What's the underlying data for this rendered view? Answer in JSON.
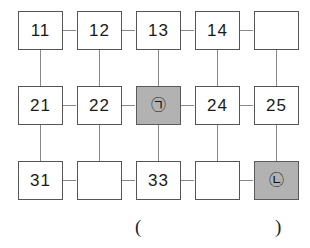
{
  "diagram": {
    "colors": {
      "cell_fill": "#ffffff",
      "cell_border": "#555555",
      "shaded_fill": "#b2b2b2",
      "connector": "#888888",
      "text": "#1a1a1a"
    },
    "rows": [
      {
        "row_index": 1,
        "cells": [
          {
            "label": "11",
            "shaded": false
          },
          {
            "label": "12",
            "shaded": false
          },
          {
            "label": "13",
            "shaded": false
          },
          {
            "label": "14",
            "shaded": false
          },
          {
            "label": "",
            "shaded": false
          }
        ]
      },
      {
        "row_index": 2,
        "cells": [
          {
            "label": "21",
            "shaded": false
          },
          {
            "label": "22",
            "shaded": false
          },
          {
            "label": "㉠",
            "shaded": true
          },
          {
            "label": "24",
            "shaded": false
          },
          {
            "label": "25",
            "shaded": false
          }
        ]
      },
      {
        "row_index": 3,
        "cells": [
          {
            "label": "31",
            "shaded": false
          },
          {
            "label": "",
            "shaded": false
          },
          {
            "label": "33",
            "shaded": false
          },
          {
            "label": "",
            "shaded": false
          },
          {
            "label": "㉡",
            "shaded": true
          }
        ]
      }
    ],
    "caption": {
      "open_paren": "(",
      "close_paren": ")"
    }
  }
}
